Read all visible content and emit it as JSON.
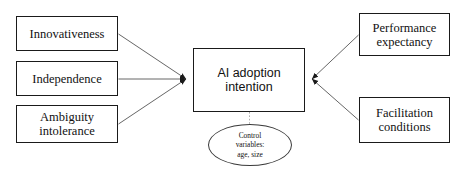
{
  "diagram": {
    "type": "research-conceptual-model",
    "background_color": "#ffffff",
    "line_color": "#555555",
    "border_color": "#1a1a1a",
    "antecedents": [
      {
        "id": "innovativeness",
        "label": "Innovativeness"
      },
      {
        "id": "independence",
        "label": "Independence"
      },
      {
        "id": "ambiguity-intolerance",
        "label": "Ambiguity\nintolerance"
      }
    ],
    "center": {
      "id": "ai-adoption-intention",
      "label": "AI adoption\nintention"
    },
    "outcomes": [
      {
        "id": "performance-expectancy",
        "label": "Performance\nexpectancy"
      },
      {
        "id": "facilitation-conditions",
        "label": "Facilitation\nconditions"
      }
    ],
    "control": {
      "id": "control-variables",
      "label": "Control\nvariables:\nage, size"
    }
  }
}
